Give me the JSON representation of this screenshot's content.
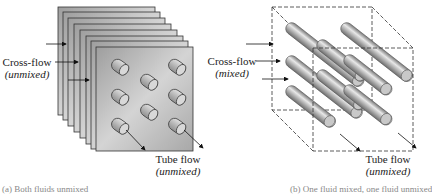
{
  "panel_a": {
    "title": "Both fluids unmixed",
    "cross_flow_label": "Cross-flow",
    "cross_flow_state": "(unmixed)",
    "tube_flow_label": "Tube flow",
    "tube_flow_state": "(unmixed)",
    "caption": "(a) Both fluids unmixed",
    "plate_count": 8,
    "tube_rows": 3,
    "tube_cols": 3
  },
  "panel_b": {
    "title": "One fluid mixed, one fluid unmixed",
    "cross_flow_label": "Cross-flow",
    "cross_flow_state": "(mixed)",
    "tube_flow_label": "Tube flow",
    "tube_flow_state": "(unmixed)",
    "caption": "(b) One fluid mixed, one fluid unmixed"
  },
  "colors": {
    "plate_fill": "#b8b8b8",
    "plate_edge": "#333333",
    "tube_fill": "#a0a0a0",
    "dashed_box": "#333333"
  }
}
